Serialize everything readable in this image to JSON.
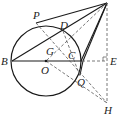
{
  "diagram": {
    "type": "geometry",
    "colors": {
      "stroke": "#1a1a1a",
      "background": "#ffffff",
      "label": "#222222"
    },
    "circle": {
      "center": "O",
      "cx": 46,
      "cy": 61,
      "r": 35
    },
    "points": {
      "A": {
        "x": 107,
        "y": 3,
        "label": ""
      },
      "B": {
        "x": 12,
        "y": 61,
        "label": "B"
      },
      "O": {
        "x": 46,
        "y": 61,
        "label": "O"
      },
      "C": {
        "x": 82,
        "y": 61,
        "label": "C"
      },
      "D": {
        "x": 63,
        "y": 31,
        "label": "D"
      },
      "P": {
        "x": 36,
        "y": 22,
        "label": "P"
      },
      "G": {
        "x": 53,
        "y": 49,
        "label": "G"
      },
      "Q": {
        "x": 80,
        "y": 76,
        "label": "Q"
      },
      "E": {
        "x": 107,
        "y": 61,
        "label": "E"
      },
      "H": {
        "x": 107,
        "y": 103,
        "label": "H"
      }
    },
    "labels": {
      "P": "P",
      "D": "D",
      "G": "G",
      "C": "C",
      "B": "B",
      "O": "O",
      "E": "E",
      "Q": "Q",
      "H": "H"
    },
    "solid_segments": [
      "A-P",
      "A-B",
      "A-C",
      "A-Q",
      "B-C"
    ],
    "dashed_segments": [
      "A-E",
      "E-H",
      "C-E",
      "P-H",
      "O-H",
      "A-G",
      "B-D"
    ],
    "right_angle": "E"
  }
}
